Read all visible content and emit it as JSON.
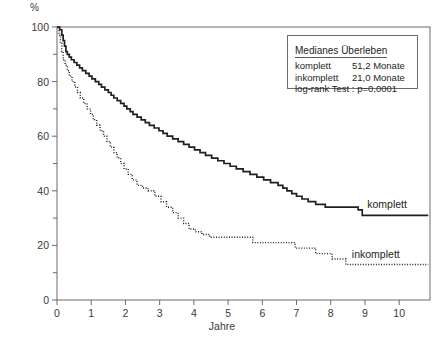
{
  "axes": {
    "y_unit": "%",
    "y_ticks_major": [
      0,
      20,
      40,
      60,
      80,
      100
    ],
    "y_ticks_minor": [
      10,
      30,
      50,
      70,
      90
    ],
    "x_title": "Jahre",
    "x_ticks": [
      0,
      1,
      2,
      3,
      4,
      5,
      6,
      7,
      8,
      9,
      10
    ]
  },
  "legend": {
    "title": "Medianes Überleben",
    "rows": [
      {
        "label": "komplett",
        "value": "51,2 Monate"
      },
      {
        "label": "inkomplett",
        "value": "21,0 Monate"
      }
    ],
    "test": "log-rank Test : p=0,0001"
  },
  "curve_labels": {
    "komplett": "komplett",
    "inkomplett": "inkomplett"
  },
  "colors": {
    "curve": "#231f20",
    "frame": "#6b6b6b",
    "text": "#231f20"
  },
  "chart_data": {
    "type": "line",
    "title": "",
    "subtitle": "",
    "xlabel": "Jahre",
    "ylabel": "%",
    "xlim": [
      0,
      10.9
    ],
    "ylim": [
      0,
      100
    ],
    "grid": false,
    "legend_position": "inline-right",
    "annotations": [
      "Medianes Überleben",
      "komplett 51,2 Monate",
      "inkomplett 21,0 Monate",
      "log-rank Test : p=0,0001"
    ],
    "series": [
      {
        "name": "komplett",
        "style": "solid",
        "median_survival_months": 51.2,
        "points": [
          [
            0.0,
            100
          ],
          [
            0.08,
            99
          ],
          [
            0.14,
            97
          ],
          [
            0.18,
            95
          ],
          [
            0.22,
            93
          ],
          [
            0.26,
            91
          ],
          [
            0.3,
            90
          ],
          [
            0.36,
            89
          ],
          [
            0.42,
            88
          ],
          [
            0.5,
            87
          ],
          [
            0.58,
            86
          ],
          [
            0.66,
            85
          ],
          [
            0.74,
            84
          ],
          [
            0.84,
            83
          ],
          [
            0.94,
            82
          ],
          [
            1.02,
            81
          ],
          [
            1.12,
            80
          ],
          [
            1.22,
            79
          ],
          [
            1.3,
            78
          ],
          [
            1.4,
            77
          ],
          [
            1.5,
            76
          ],
          [
            1.58,
            75
          ],
          [
            1.66,
            74
          ],
          [
            1.76,
            73
          ],
          [
            1.86,
            72
          ],
          [
            1.96,
            71
          ],
          [
            2.04,
            70
          ],
          [
            2.14,
            69
          ],
          [
            2.22,
            68
          ],
          [
            2.34,
            67
          ],
          [
            2.46,
            66
          ],
          [
            2.58,
            65
          ],
          [
            2.7,
            64
          ],
          [
            2.84,
            63
          ],
          [
            2.98,
            62
          ],
          [
            3.1,
            61
          ],
          [
            3.22,
            60
          ],
          [
            3.38,
            59
          ],
          [
            3.54,
            58
          ],
          [
            3.7,
            57
          ],
          [
            3.86,
            56
          ],
          [
            4.02,
            55
          ],
          [
            4.18,
            54
          ],
          [
            4.34,
            53
          ],
          [
            4.52,
            52
          ],
          [
            4.7,
            51
          ],
          [
            4.88,
            50
          ],
          [
            5.06,
            49
          ],
          [
            5.24,
            48
          ],
          [
            5.44,
            47
          ],
          [
            5.64,
            46
          ],
          [
            5.84,
            45
          ],
          [
            6.04,
            44
          ],
          [
            6.24,
            43
          ],
          [
            6.46,
            42
          ],
          [
            6.6,
            41
          ],
          [
            6.72,
            40
          ],
          [
            6.86,
            39
          ],
          [
            7.0,
            38
          ],
          [
            7.16,
            37
          ],
          [
            7.34,
            36
          ],
          [
            7.56,
            35
          ],
          [
            7.84,
            34
          ],
          [
            8.8,
            33
          ],
          [
            8.92,
            31
          ],
          [
            10.85,
            31
          ]
        ]
      },
      {
        "name": "inkomplett",
        "style": "dotted",
        "median_survival_months": 21.0,
        "points": [
          [
            0.0,
            100
          ],
          [
            0.06,
            97
          ],
          [
            0.1,
            94
          ],
          [
            0.14,
            91
          ],
          [
            0.18,
            88
          ],
          [
            0.24,
            86
          ],
          [
            0.3,
            84
          ],
          [
            0.36,
            82
          ],
          [
            0.44,
            80
          ],
          [
            0.52,
            78
          ],
          [
            0.6,
            76
          ],
          [
            0.68,
            74
          ],
          [
            0.78,
            72
          ],
          [
            0.88,
            70
          ],
          [
            0.98,
            68
          ],
          [
            1.06,
            66
          ],
          [
            1.16,
            64
          ],
          [
            1.26,
            62
          ],
          [
            1.36,
            60
          ],
          [
            1.46,
            58
          ],
          [
            1.56,
            56
          ],
          [
            1.66,
            54
          ],
          [
            1.76,
            52
          ],
          [
            1.86,
            50
          ],
          [
            1.96,
            48
          ],
          [
            2.08,
            46
          ],
          [
            2.2,
            44
          ],
          [
            2.34,
            42
          ],
          [
            2.5,
            41
          ],
          [
            2.66,
            40
          ],
          [
            2.86,
            38
          ],
          [
            3.04,
            36
          ],
          [
            3.2,
            34
          ],
          [
            3.38,
            32
          ],
          [
            3.54,
            30
          ],
          [
            3.7,
            28
          ],
          [
            3.86,
            26
          ],
          [
            4.04,
            25
          ],
          [
            4.24,
            24
          ],
          [
            4.46,
            23
          ],
          [
            5.6,
            23
          ],
          [
            5.72,
            21
          ],
          [
            6.8,
            21
          ],
          [
            6.96,
            19
          ],
          [
            7.4,
            19
          ],
          [
            7.56,
            17
          ],
          [
            7.9,
            17
          ],
          [
            8.04,
            15
          ],
          [
            8.3,
            15
          ],
          [
            8.44,
            13
          ],
          [
            10.85,
            13
          ]
        ]
      }
    ]
  }
}
